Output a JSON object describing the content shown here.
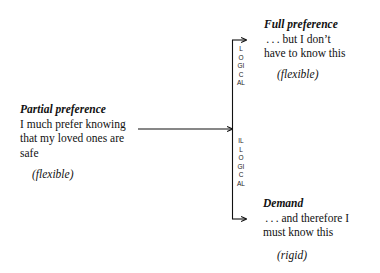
{
  "diagram": {
    "partial": {
      "title": "Partial preference",
      "lines": [
        "I much prefer knowing",
        "that my loved ones are",
        "safe"
      ],
      "qualifier": "(flexible)"
    },
    "full": {
      "title": "Full preference",
      "lines": [
        " . . . but I don’t",
        "have to know this"
      ],
      "qualifier": "(flexible)"
    },
    "demand": {
      "title": "Demand",
      "lines": [
        " . . . and therefore I",
        "must know this"
      ],
      "qualifier": "(rigid)"
    },
    "branches": {
      "upper_label": "LOGICAL",
      "lower_label": "ILLOGICAL"
    },
    "edges": [
      {
        "from": "partial",
        "to": "branch-point"
      },
      {
        "from": "branch-point",
        "to": "full",
        "label": "LOGICAL"
      },
      {
        "from": "branch-point",
        "to": "demand",
        "label": "ILLOGICAL"
      }
    ]
  }
}
